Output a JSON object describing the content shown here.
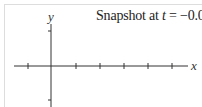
{
  "diagram": {
    "title_prefix": "Snapshot at ",
    "title_var": "t",
    "title_suffix": " = −0.02 s",
    "x_label": "x",
    "y_label": "y",
    "axis_color": "#333333",
    "x_ticks_px": [
      28,
      76,
      100,
      124,
      148,
      172
    ],
    "y_ticks_px": [
      31,
      100
    ]
  }
}
